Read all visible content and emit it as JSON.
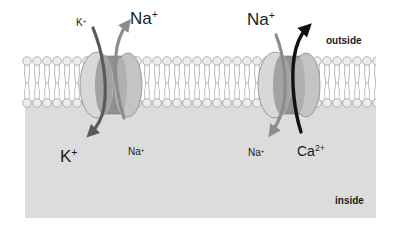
{
  "diagram": {
    "regions": {
      "outside": "outside",
      "inside": "inside"
    },
    "colors": {
      "background": "#ffffff",
      "cytoplasm": "#dcdcdc",
      "lipid_head": "#e6e6e6",
      "lipid_tail": "#9a9a9a",
      "protein_outer": "#d6d6d6",
      "protein_middle": "#8f8f8f",
      "protein_right": "#bdbdbd",
      "arrow_k": "#5a5a5a",
      "arrow_na": "#8c8c8c",
      "arrow_ca": "#111111"
    },
    "channels": [
      {
        "name": "K/Na channel",
        "top_labels": [
          {
            "ion": "K",
            "charge": "+",
            "size": "small"
          },
          {
            "ion": "Na",
            "charge": "+",
            "size": "large"
          }
        ],
        "bottom_labels": [
          {
            "ion": "K",
            "charge": "+",
            "size": "large"
          },
          {
            "ion": "Na",
            "charge": "+",
            "size": "small"
          }
        ],
        "flows": [
          {
            "ion": "K+",
            "direction": "inward"
          },
          {
            "ion": "Na+",
            "direction": "outward"
          }
        ]
      },
      {
        "name": "Na/Ca channel",
        "top_labels": [
          {
            "ion": "Na",
            "charge": "+",
            "size": "large"
          }
        ],
        "bottom_labels": [
          {
            "ion": "Na",
            "charge": "+",
            "size": "small"
          },
          {
            "ion": "Ca",
            "charge": "2+",
            "size": "large"
          }
        ],
        "flows": [
          {
            "ion": "Na+",
            "direction": "inward"
          },
          {
            "ion": "Ca2+",
            "direction": "outward"
          }
        ]
      }
    ]
  }
}
